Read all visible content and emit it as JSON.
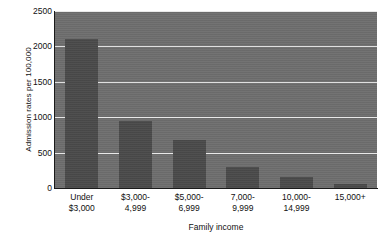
{
  "chart_data": {
    "type": "bar",
    "title": "",
    "subtitle": "",
    "xlabel": "Family income",
    "ylabel": "Admission rates per 100,000",
    "categories": [
      "Under\n$3,000",
      "$3,000-\n4,999",
      "$5,000-\n6,999",
      "7,000-\n9,999",
      "10,000-\n14,999",
      "15,000+"
    ],
    "category_lines": [
      [
        "Under",
        "$3,000"
      ],
      [
        "$3,000-",
        "4,999"
      ],
      [
        "$5,000-",
        "6,999"
      ],
      [
        "7,000-",
        "9,999"
      ],
      [
        "10,000-",
        "14,999"
      ],
      [
        "15,000+",
        ""
      ]
    ],
    "values": [
      2100,
      950,
      680,
      300,
      160,
      55
    ],
    "ylim": [
      0,
      2500
    ],
    "yticks": [
      0,
      500,
      1000,
      1500,
      2000,
      2500
    ],
    "ytick_labels": [
      "0",
      "500",
      "1000",
      "1500",
      "2000",
      "2500"
    ],
    "grid": true,
    "grid_axis": "y",
    "legend": false,
    "legend_position": "none",
    "colors": {
      "bar": "#4a4a4a",
      "plot_background": "#6e6e6e",
      "gridline": "#e8e8e8",
      "axis": "#1a1a1a",
      "text": "#111111",
      "figure_background": "#ffffff"
    }
  }
}
